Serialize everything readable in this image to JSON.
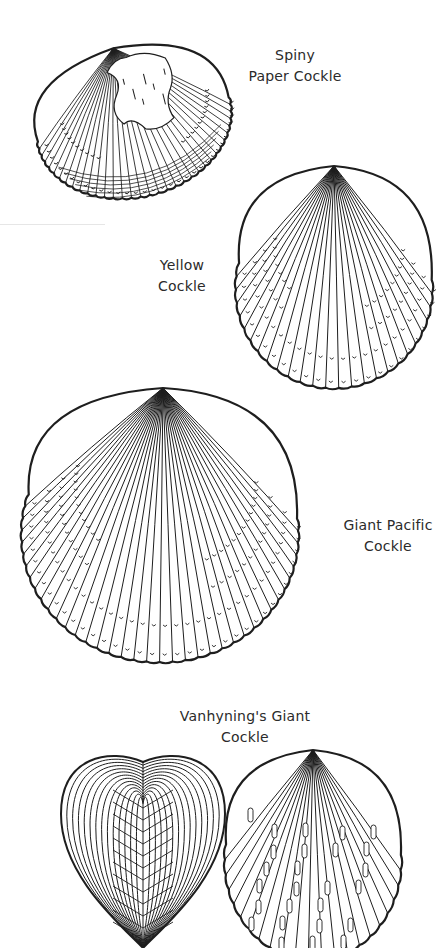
{
  "page": {
    "background": "#ffffff",
    "ink_color": "#1e1e1e"
  },
  "shells": [
    {
      "id": "spiny-paper-cockle",
      "label_lines": [
        "Spiny",
        "Paper Cockle"
      ],
      "rib_count": 34
    },
    {
      "id": "yellow-cockle",
      "label_lines": [
        "Yellow",
        "Cockle"
      ],
      "rib_count": 26
    },
    {
      "id": "giant-pacific-cockle",
      "label_lines": [
        "Giant Pacific",
        "Cockle"
      ],
      "rib_count": 38
    },
    {
      "id": "vanhynings-giant-cockle",
      "label_lines": [
        "Vanhyning's Giant",
        "Cockle"
      ],
      "views": [
        "front-heart-view",
        "side-view"
      ],
      "rib_count": 22
    }
  ]
}
